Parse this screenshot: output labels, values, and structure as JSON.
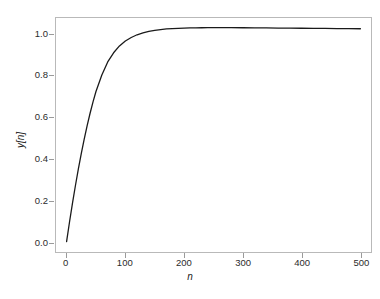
{
  "chart_data": {
    "type": "line",
    "title": "",
    "subtitle": "",
    "xlabel": "n",
    "ylabel": "y[n]",
    "xlim": [
      -18,
      518
    ],
    "ylim": [
      -0.05,
      1.08
    ],
    "xticks": [
      0,
      100,
      200,
      300,
      400,
      500
    ],
    "xticklabels": [
      "0",
      "100",
      "200",
      "300",
      "400",
      "500"
    ],
    "yticks": [
      0.0,
      0.2,
      0.4,
      0.6,
      0.8,
      1.0
    ],
    "yticklabels": [
      "0.0",
      "0.2",
      "0.4",
      "0.6",
      "0.8",
      "1.0"
    ],
    "grid": false,
    "legend": false,
    "legend_position": "none",
    "line_color": "#1a1a1a",
    "line_width": 1.3,
    "frame_color": "#b9b9b9",
    "background_color": "#ffffff",
    "series": [
      {
        "name": "y[n]",
        "x": [
          0,
          5,
          10,
          15,
          20,
          25,
          30,
          35,
          40,
          45,
          50,
          60,
          70,
          80,
          90,
          100,
          110,
          120,
          130,
          140,
          150,
          160,
          170,
          180,
          190,
          200,
          210,
          220,
          230,
          240,
          250,
          260,
          280,
          300,
          320,
          340,
          360,
          380,
          400,
          420,
          440,
          460,
          480,
          500
        ],
        "y": [
          0.0,
          0.095,
          0.185,
          0.27,
          0.35,
          0.425,
          0.495,
          0.56,
          0.62,
          0.675,
          0.725,
          0.805,
          0.868,
          0.912,
          0.945,
          0.969,
          0.986,
          0.999,
          1.008,
          1.015,
          1.02,
          1.024,
          1.027,
          1.029,
          1.03,
          1.031,
          1.032,
          1.0325,
          1.033,
          1.0333,
          1.0335,
          1.0335,
          1.0333,
          1.033,
          1.0325,
          1.032,
          1.0315,
          1.031,
          1.0305,
          1.03,
          1.0295,
          1.029,
          1.0285,
          1.028
        ]
      }
    ]
  }
}
